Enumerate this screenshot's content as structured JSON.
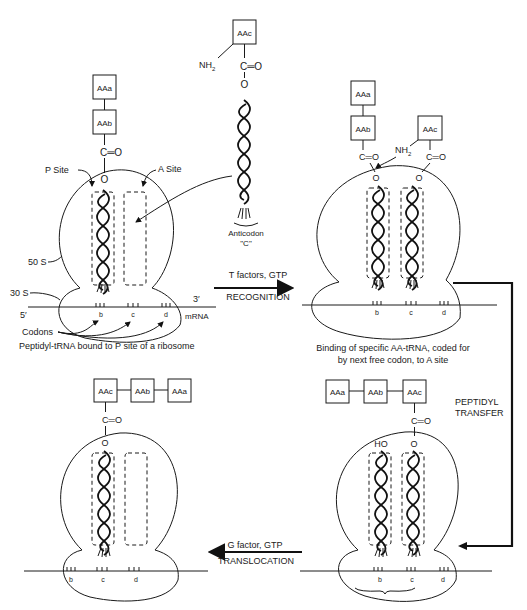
{
  "diagram": {
    "labels": {
      "aa_a": "AAa",
      "aa_b": "AAb",
      "aa_c": "AAc",
      "carbonyl": "C═O",
      "oxygen": "O",
      "hydroxyl": "HO",
      "amine": "NH",
      "amine_sub": "2",
      "p_site": "P  Site",
      "a_site": "A Site",
      "subunit_50s": "50 S",
      "subunit_30s": "30 S",
      "five_prime": "5′",
      "three_prime": "3′",
      "mrna": "mRNA",
      "codons": "Codons",
      "codon_b": "b",
      "codon_c": "c",
      "codon_d": "d",
      "anticodon": "Anticodon",
      "anticodon_name": "\"C\""
    },
    "steps": {
      "recognition": {
        "top": "T factors, GTP",
        "bottom": "RECOGNITION"
      },
      "peptidyl_transfer": {
        "line1": "PEPTIDYL",
        "line2": "TRANSFER"
      },
      "translocation": {
        "top": "G factor, GTP",
        "bottom": "TRANSLOCATION"
      }
    },
    "captions": {
      "panel1": "Peptidyl-tRNA bound to P site of a ribosome",
      "panel2_line1": "Binding of specific AA-tRNA, coded for",
      "panel2_line2": "by next free codon, to A site"
    },
    "colors": {
      "ink": "#1a1a1a",
      "background": "#ffffff"
    }
  }
}
